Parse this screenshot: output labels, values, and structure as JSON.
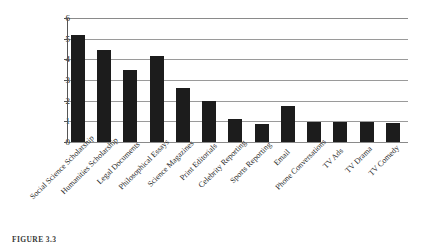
{
  "figure": {
    "caption": "FIGURE 3.3"
  },
  "chart_data": {
    "type": "bar",
    "title": "",
    "xlabel": "",
    "ylabel": "",
    "ylim": [
      0,
      6
    ],
    "yticks": [
      0,
      1,
      2,
      3,
      4,
      5,
      6
    ],
    "ytick_labels": [
      "0",
      "1",
      "2",
      "3",
      "4",
      "5",
      "6"
    ],
    "grid": true,
    "legend": false,
    "bar_color": "#1c1c1c",
    "gridline_color": "#9a9a9a",
    "axis_color": "#555555",
    "background_color": "#ffffff",
    "xtick_rotation": -45,
    "categories": [
      "Social Science Scholarship",
      "Humanities Scholarship",
      "Legal Documents",
      "Philosophical Essays",
      "Science Magazines",
      "Print Editorials",
      "Celebrity Reporting",
      "Sports Reporting",
      "Email",
      "Phone Conversations",
      "TV Ads",
      "TV Drama",
      "TV Comedy"
    ],
    "values": [
      5.2,
      4.45,
      3.5,
      4.15,
      2.62,
      2.0,
      1.12,
      0.88,
      1.72,
      0.98,
      0.95,
      0.99,
      0.92
    ]
  }
}
